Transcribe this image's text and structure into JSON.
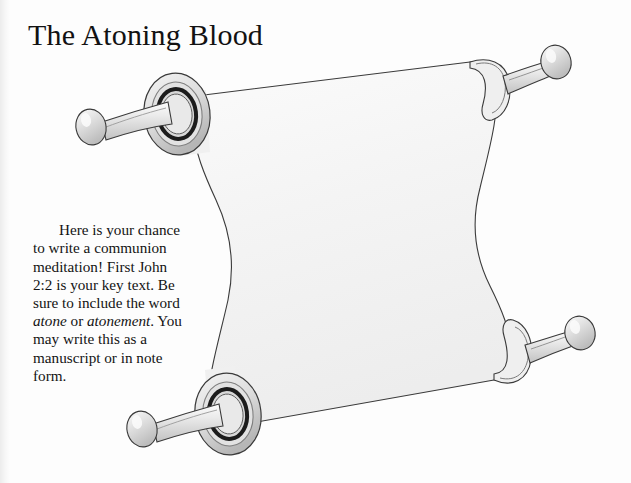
{
  "page": {
    "title": "The Atoning Blood",
    "background_color": "#fdfdfd",
    "width": 631,
    "height": 483
  },
  "instructions": {
    "line1": "Here is your chance to write a communion meditation! First John 2:2 is your key text. Be sure to include the word ",
    "keyword1": "atone",
    "conjunction": " or ",
    "keyword2": "atonement",
    "line2": ". You may write this as a manuscript or in note form.",
    "full_text": "Here is your chance to write a communion meditation! First John 2:2 is your key text. Be sure to include the word atone or atonement. You may write this as a manuscript or in note form."
  },
  "illustration": {
    "name": "open-scroll",
    "description": "Open parchment scroll with two rods top and bottom, each with knobbed handles",
    "colors": {
      "parchment": "#f7f7f7",
      "parchment_shade": "#ededed",
      "outline": "#3a3a3a",
      "rod_light": "#f0f0f0",
      "rod_mid": "#d4d4d4",
      "rod_dark": "#a8a8a8",
      "ring_dark": "#1c1c1c",
      "ring_mid": "#8f8f8f"
    },
    "parts": [
      {
        "name": "rod-cap-top-left",
        "type": "front-ring"
      },
      {
        "name": "rod-cap-top-right",
        "type": "back-ring"
      },
      {
        "name": "rod-cap-bottom-left",
        "type": "front-ring"
      },
      {
        "name": "rod-cap-bottom-right",
        "type": "back-ring"
      },
      {
        "name": "scroll-sheet",
        "type": "parchment"
      }
    ]
  }
}
